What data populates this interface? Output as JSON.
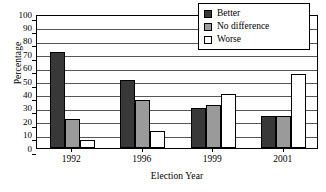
{
  "chart_data": {
    "type": "bar",
    "title": "",
    "xlabel": "Election Year",
    "ylabel": "Percentage",
    "categories": [
      "1992",
      "1996",
      "1999",
      "2001"
    ],
    "series": [
      {
        "name": "Better",
        "values": [
          72,
          51,
          30,
          24
        ],
        "color": "#383838"
      },
      {
        "name": "No difference",
        "values": [
          22,
          36,
          32,
          24
        ],
        "color": "#9a9a9a"
      },
      {
        "name": "Worse",
        "values": [
          6,
          13,
          40,
          55
        ],
        "color": "#ffffff"
      }
    ],
    "ylim": [
      0,
      100
    ],
    "ytick_step": 10,
    "yticks": [
      "0",
      "10",
      "20",
      "30",
      "40",
      "50",
      "60",
      "70",
      "80",
      "90",
      "100"
    ],
    "grid": "horizontal",
    "legend_position": "upper-right-inside"
  },
  "axes": {
    "ylabel": "Percentage",
    "xlabel": "Election Year"
  },
  "legend": {
    "items": [
      {
        "label": "Better"
      },
      {
        "label": "No difference"
      },
      {
        "label": "Worse"
      }
    ]
  }
}
